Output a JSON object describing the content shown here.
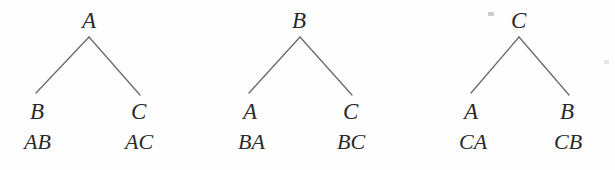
{
  "figure": {
    "type": "tree-diagram-set",
    "background_color": "#fefefe",
    "edge_color": "#6a6a6a",
    "text_color": "#2a2a2a",
    "trees": [
      {
        "name": "tree-a",
        "root": "A",
        "root_x": 89,
        "root_y": 25,
        "apex_x": 89,
        "apex_y": 37,
        "left": {
          "node": "B",
          "path": "AB",
          "x": 30,
          "end_x": 36,
          "end_y": 93
        },
        "right": {
          "node": "C",
          "path": "AC",
          "x": 131,
          "end_x": 140,
          "end_y": 95
        }
      },
      {
        "name": "tree-b",
        "root": "B",
        "root_x": 300,
        "root_y": 25,
        "apex_x": 300,
        "apex_y": 37,
        "left": {
          "node": "A",
          "path": "BA",
          "x": 243,
          "end_x": 249,
          "end_y": 93
        },
        "right": {
          "node": "C",
          "path": "BC",
          "x": 343,
          "end_x": 352,
          "end_y": 95
        }
      },
      {
        "name": "tree-c",
        "root": "C",
        "root_x": 519,
        "root_y": 25,
        "apex_x": 519,
        "apex_y": 37,
        "left": {
          "node": "A",
          "path": "CA",
          "x": 464,
          "end_x": 471,
          "end_y": 93
        },
        "right": {
          "node": "B",
          "path": "CB",
          "x": 560,
          "end_x": 569,
          "end_y": 95
        }
      }
    ],
    "leaf_label_y": 106,
    "path_label_y": 136,
    "artifacts": [
      {
        "name": "scan-speck",
        "x": 488,
        "y": 12,
        "width": 6,
        "height": 4
      },
      {
        "name": "scan-speck-faint",
        "x": 604,
        "y": 60,
        "width": 5,
        "height": 4
      }
    ]
  }
}
